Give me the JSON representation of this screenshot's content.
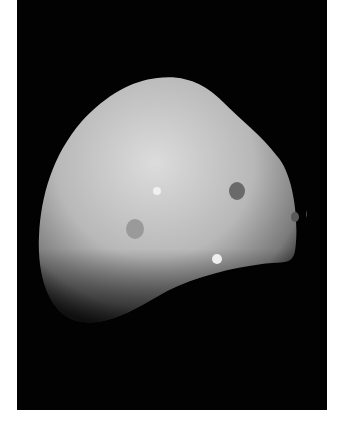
{
  "image": {
    "subject": "Irregular moon (Deimos) against black space",
    "alt": "Grayscale photograph of a lumpy, cratered moon on a black background",
    "colors": {
      "background": "#020202",
      "border": "#ffffff",
      "surface_light": "#d8d8d8",
      "surface_dark": "#5a5a5a"
    }
  }
}
